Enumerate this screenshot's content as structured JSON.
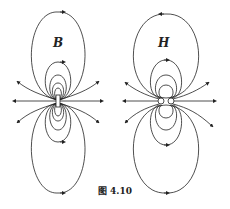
{
  "figure": {
    "caption": "图 4.10",
    "panels": [
      {
        "label": "B",
        "description": "Magnetic field B of a magnetized object (field lines continuous through the magnet)"
      },
      {
        "label": "H",
        "description": "Auxiliary field H of a magnetized object (field lines begin/end at pole surfaces)"
      }
    ]
  },
  "colors": {
    "line": "#222222",
    "background": "#ffffff"
  }
}
